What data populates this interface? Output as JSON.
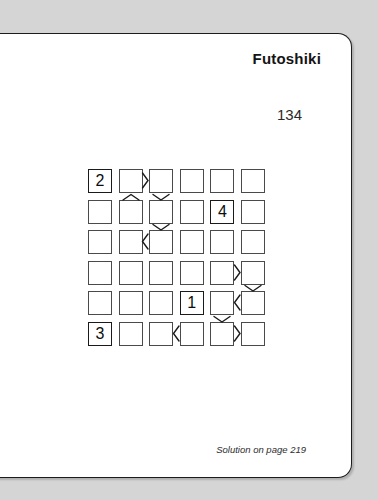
{
  "page": {
    "title": "Futoshiki",
    "number": "134",
    "footer": "Solution on page 219",
    "background_color": "#d5d5d5",
    "paper_color": "#ffffff",
    "ink_color": "#1a1a1a"
  },
  "puzzle": {
    "type": "futoshiki",
    "size": 6,
    "rows": 6,
    "cols": 6,
    "givens": [
      {
        "row": 0,
        "col": 0,
        "value": "2"
      },
      {
        "row": 1,
        "col": 4,
        "value": "4"
      },
      {
        "row": 4,
        "col": 3,
        "value": "1"
      },
      {
        "row": 5,
        "col": 0,
        "value": "3"
      }
    ],
    "cells": [
      [
        "2",
        "",
        "",
        "",
        "",
        ""
      ],
      [
        "",
        "",
        "",
        "",
        "4",
        ""
      ],
      [
        "",
        "",
        "",
        "",
        "",
        ""
      ],
      [
        "",
        "",
        "",
        "",
        "",
        ""
      ],
      [
        "",
        "",
        "",
        "1",
        "",
        ""
      ],
      [
        "3",
        "",
        "",
        "",
        "",
        ""
      ]
    ],
    "horizontal_constraints": [
      {
        "row": 0,
        "left_col": 1,
        "right_col": 2,
        "sign": ">"
      },
      {
        "row": 2,
        "left_col": 1,
        "right_col": 2,
        "sign": "<"
      },
      {
        "row": 3,
        "left_col": 4,
        "right_col": 5,
        "sign": ">"
      },
      {
        "row": 4,
        "left_col": 4,
        "right_col": 5,
        "sign": "<"
      },
      {
        "row": 5,
        "left_col": 2,
        "right_col": 3,
        "sign": "<"
      },
      {
        "row": 5,
        "left_col": 4,
        "right_col": 5,
        "sign": ">"
      }
    ],
    "vertical_constraints": [
      {
        "col": 1,
        "top_row": 0,
        "bottom_row": 1,
        "sign": "^"
      },
      {
        "col": 2,
        "top_row": 0,
        "bottom_row": 1,
        "sign": "v"
      },
      {
        "col": 2,
        "top_row": 1,
        "bottom_row": 2,
        "sign": "v"
      },
      {
        "col": 5,
        "top_row": 3,
        "bottom_row": 4,
        "sign": "v"
      },
      {
        "col": 4,
        "top_row": 4,
        "bottom_row": 5,
        "sign": "v"
      }
    ]
  }
}
